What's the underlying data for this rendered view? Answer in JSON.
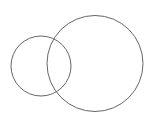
{
  "diagram": {
    "type": "venn",
    "background": "#ffffff",
    "stroke_color": "#666666",
    "circles": [
      {
        "name": "small-circle",
        "cx": 41,
        "cy": 66,
        "r": 30
      },
      {
        "name": "large-circle",
        "cx": 95,
        "cy": 63.5,
        "r": 48
      }
    ]
  }
}
